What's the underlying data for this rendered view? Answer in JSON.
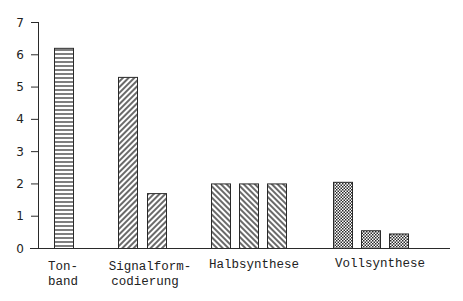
{
  "chart_data": {
    "type": "bar",
    "title": "",
    "xlabel": "",
    "ylabel": "",
    "ylim": [
      0,
      7
    ],
    "yticks": [
      0,
      1,
      2,
      3,
      4,
      5,
      6,
      7
    ],
    "grid": false,
    "legend": null,
    "groups": [
      {
        "label_lines": [
          "Ton-",
          "band"
        ],
        "pattern": "horizontal-lines",
        "values": [
          6.2
        ]
      },
      {
        "label_lines": [
          "Signalform-",
          "codierung"
        ],
        "pattern": "diagonal-forward",
        "values": [
          5.3,
          1.7
        ]
      },
      {
        "label_lines": [
          "Halbsynthese"
        ],
        "pattern": "diagonal-backward",
        "values": [
          2.0,
          2.0,
          2.0
        ]
      },
      {
        "label_lines": [
          "Vollsynthese"
        ],
        "pattern": "checker",
        "values": [
          2.05,
          0.55,
          0.45
        ]
      }
    ],
    "categories": [
      "Tonband",
      "Signalformcodierung",
      "Halbsynthese",
      "Vollsynthese"
    ]
  },
  "axis": {
    "tick_labels": [
      "0",
      "1",
      "2",
      "3",
      "4",
      "5",
      "6",
      "7"
    ]
  },
  "labels": {
    "tonband_1": "Ton-",
    "tonband_2": "band",
    "signal_1": "Signalform-",
    "signal_2": "codierung",
    "halb": "Halbsynthese",
    "voll": "Vollsynthese"
  },
  "colors": {
    "ink": "#2a2a2a",
    "background": "#ffffff"
  }
}
